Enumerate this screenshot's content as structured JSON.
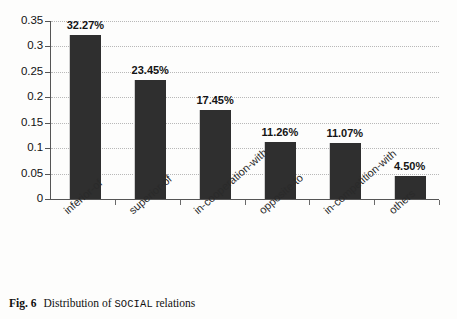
{
  "figure": {
    "caption_number": "Fig. 6",
    "caption_prefix": "Distribution of",
    "caption_mono_term": "SOCIAL",
    "caption_suffix": "relations"
  },
  "chart_data": {
    "type": "bar",
    "title": "",
    "xlabel": "",
    "ylabel": "",
    "categories": [
      "inferior-of",
      "superior-of",
      "in-cooperation-with",
      "opposite-to",
      "in-competition-with",
      "others"
    ],
    "values": [
      0.3227,
      0.2345,
      0.1745,
      0.1126,
      0.1107,
      0.045
    ],
    "data_labels": [
      "32.27%",
      "23.45%",
      "17.45%",
      "11.26%",
      "11.07%",
      "4.50%"
    ],
    "ylim": [
      0,
      0.35
    ],
    "ytick_labels": [
      "0",
      "0.05",
      "0.1",
      "0.15",
      "0.2",
      "0.25",
      "0.3",
      "0.35"
    ],
    "ytick_values": [
      0,
      0.05,
      0.1,
      0.15,
      0.2,
      0.25,
      0.3,
      0.35
    ],
    "grid": true,
    "grid_axis": "y",
    "legend": false,
    "legend_position": "none",
    "bar_color": "#2f2f2f",
    "grid_color": "#b8b8b8",
    "axis_color": "#555555"
  }
}
